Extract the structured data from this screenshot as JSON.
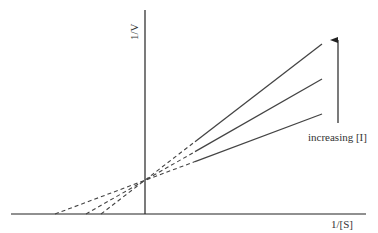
{
  "chart_data": {
    "type": "line",
    "title": "",
    "xlabel": "1/[S]",
    "ylabel": "1/V",
    "annotation": "increasing [I]",
    "grid": false,
    "legend": null,
    "axes_px": {
      "origin": [
        145,
        214
      ],
      "x_range": [
        11,
        366
      ],
      "y_range": [
        214,
        10
      ]
    },
    "intersection_px": [
      138,
      182
    ],
    "series": [
      {
        "name": "low [I]",
        "x_intercept_px": 55,
        "end_px": [
          322,
          114
        ]
      },
      {
        "name": "medium [I]",
        "x_intercept_px": 86,
        "end_px": [
          322,
          79
        ]
      },
      {
        "name": "high [I]",
        "x_intercept_px": 101,
        "end_px": [
          322,
          44
        ]
      }
    ],
    "arrow": {
      "x": 338,
      "from_y": 123,
      "to_y": 32
    }
  },
  "labels": {
    "x": "1/[S]",
    "y": "1/V",
    "arrow": "increasing [I]"
  },
  "colors": {
    "line": "#444444",
    "axis": "#222222"
  }
}
